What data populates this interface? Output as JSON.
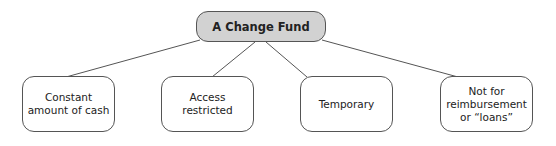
{
  "diagram": {
    "root": {
      "label": "A Change Fund"
    },
    "children": [
      {
        "label": "Constant amount of cash"
      },
      {
        "label": "Access restricted"
      },
      {
        "label": "Temporary"
      },
      {
        "label": "Not for reimbursement or “loans”"
      }
    ],
    "colors": {
      "root_fill": "#d2d2d2",
      "child_fill": "#ffffff",
      "stroke": "#555555"
    }
  }
}
